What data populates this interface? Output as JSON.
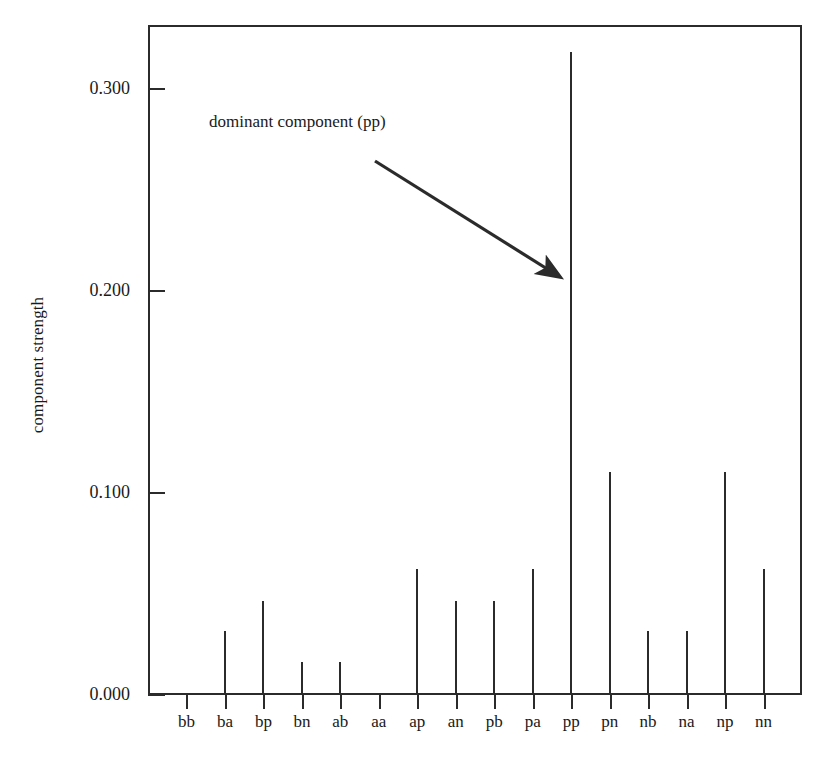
{
  "chart_data": {
    "type": "bar",
    "title": "",
    "xlabel": "",
    "ylabel": "component strength",
    "categories": [
      "bb",
      "ba",
      "bp",
      "bn",
      "ab",
      "aa",
      "ap",
      "an",
      "pb",
      "pa",
      "pp",
      "pn",
      "nb",
      "na",
      "np",
      "nn"
    ],
    "values": [
      0.0,
      0.031,
      0.046,
      0.016,
      0.016,
      0.0,
      0.062,
      0.046,
      0.046,
      0.062,
      0.318,
      0.11,
      0.031,
      0.031,
      0.11,
      0.062
    ],
    "ylim": [
      0.0,
      0.33
    ],
    "ytick_values": [
      0.0,
      0.1,
      0.2,
      0.3
    ],
    "ytick_labels": [
      "0.000",
      "0.100",
      "0.200",
      "0.300"
    ],
    "grid": false,
    "legend": false,
    "bar_color": "#2b2b2b",
    "axis_color": "#2b2b2b",
    "background_color": "#ffffff",
    "annotations": [
      {
        "text": "dominant component (pp)",
        "target_category": "pp",
        "arrow_from": [
          375,
          161
        ],
        "arrow_to": [
          560,
          277
        ]
      }
    ]
  }
}
